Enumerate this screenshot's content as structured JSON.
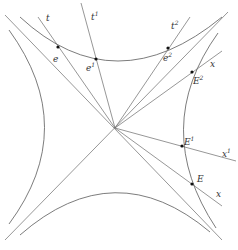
{
  "diagram": {
    "labels": {
      "t": "t",
      "t1": "t",
      "t1_sup": "1",
      "t2": "t",
      "t2_sup": "2",
      "x_upper": "x",
      "x1": "x",
      "x1_sup": "1",
      "x_lower": "x",
      "e": "e",
      "e1": "e",
      "e1_sup": "1",
      "e2": "e",
      "e2_sup": "2",
      "E": "E",
      "E1": "E",
      "E1_sup": "1",
      "E2": "E",
      "E2_sup": "2"
    },
    "colors": {
      "stroke": "#5a5a5a",
      "dot": "#111111",
      "text": "#333333",
      "background": "#ffffff"
    }
  }
}
